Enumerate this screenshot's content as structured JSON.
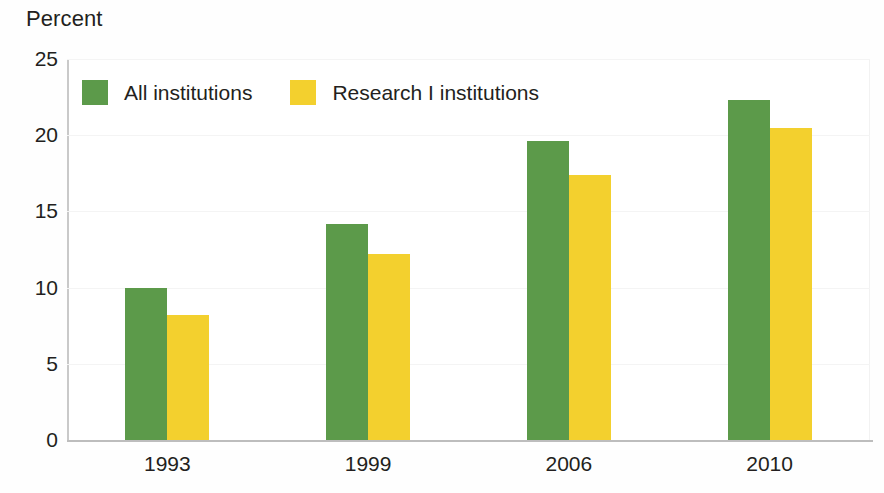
{
  "chart_data": {
    "type": "bar",
    "title": "",
    "subtitle": "",
    "xlabel": "",
    "ylabel": "Percent",
    "categories": [
      "1993",
      "1999",
      "2006",
      "2010"
    ],
    "series": [
      {
        "name": "All institutions",
        "color": "#5c9a4a",
        "values": [
          10.0,
          14.2,
          19.6,
          22.3
        ]
      },
      {
        "name": "Research I institutions",
        "color": "#f3d02e",
        "values": [
          8.2,
          12.2,
          17.4,
          20.5
        ]
      }
    ],
    "ylim": [
      0,
      25
    ],
    "yticks": [
      0,
      5,
      10,
      15,
      20,
      25
    ],
    "ytick_labels": [
      "0",
      "5",
      "10",
      "15",
      "20",
      "25"
    ],
    "grid": false,
    "legend_position": "top-left-inside",
    "annotations": []
  },
  "colors": {
    "series_1": "#5c9a4a",
    "series_2": "#f3d02e",
    "axis": "#bdbdbd",
    "text": "#231f20",
    "background": "#ffffff"
  },
  "legend": {
    "items": [
      {
        "label": "All institutions",
        "swatch": "green"
      },
      {
        "label": "Research I institutions",
        "swatch": "yellow"
      }
    ]
  }
}
